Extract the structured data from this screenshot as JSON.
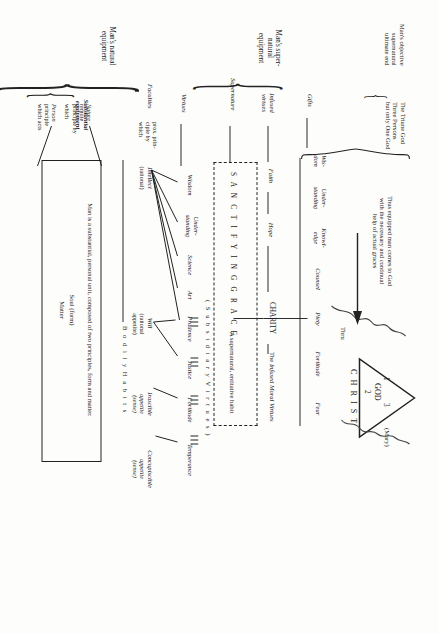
{
  "diagram": {
    "deity": {
      "label": "GOD",
      "person_numbers": [
        "1",
        "3",
        "2"
      ],
      "christ": "C H R I S T",
      "thru": "Thru",
      "mary": "(Mary)"
    },
    "objective_end": {
      "label": "Man's objective\nsupernatural\nultimate end",
      "line1": "Man's objective",
      "line2": "supernatural",
      "line3": "ultimate end",
      "content_line1": "The  Triune  God",
      "content_line2": "Three  Persons",
      "content_line3": "but only One God"
    },
    "note": {
      "line1": "Thus equipped man comes to God",
      "line2": "with the necessary and continual",
      "line3": "help of actual graces"
    },
    "supernatural_equipment": {
      "bracket_label_line1": "Man's super-",
      "bracket_label_line2": "natural",
      "bracket_label_line3": "equipment",
      "rows": [
        {
          "row_label": "Gifts",
          "items": [
            {
              "l1": "Wis-",
              "l2": "dom"
            },
            {
              "l1": "Under-",
              "l2": "standing"
            },
            {
              "l1": "Knowl-",
              "l2": "edge"
            },
            {
              "l1": "Counsel",
              "l2": ""
            },
            {
              "l1": "Piety",
              "l2": ""
            },
            {
              "l1": "Fortitude",
              "l2": ""
            },
            {
              "l1": "Fear",
              "l2": ""
            }
          ]
        },
        {
          "row_label_l1": "Infused",
          "row_label_l2": "virtues",
          "items": [
            {
              "l1": "Faith",
              "l2": ""
            },
            {
              "l1": "Hope",
              "l2": ""
            },
            {
              "l1": "CHARITY",
              "l2": ""
            },
            {
              "l1": "The Infused Moral Virtues",
              "l2": ""
            }
          ],
          "charity_caps": "CHARITY",
          "infused_moral_pre": "The ",
          "infused_moral_it": "Infused Moral Virtues"
        },
        {
          "row_label": "Supernature",
          "grace_text": "S A N C T I F Y I N G     G R A C E",
          "grace_desc": "A supernatural, entitative habit"
        }
      ]
    },
    "natural_equipment": {
      "bracket_label_line1": "Man's natural",
      "bracket_label_line2": "equipment",
      "virtues": {
        "row_label": "Virtues",
        "subsidiary_heading": "( S u b s i d i a r y   V i r t u e s )",
        "items": [
          {
            "l1": "Wisdom"
          },
          {
            "l1": "Under-",
            "l2": "standing"
          },
          {
            "l1": "Science"
          },
          {
            "l1": "Art"
          },
          {
            "l1": "Prudence"
          },
          {
            "l1": "Justice"
          },
          {
            "l1": "Fortitude"
          },
          {
            "l1": "Temperance"
          }
        ]
      },
      "faculties": {
        "row_label": "Faculties",
        "desc_l1": "prox. prin-",
        "desc_l2": "ciple by",
        "desc_l3": "which",
        "items": [
          {
            "name": "Intellect",
            "qual_l1": "(rational)",
            "qual_l2": ""
          },
          {
            "name": "Will",
            "qual_l1": "(rational",
            "qual_l2": "appetite)"
          },
          {
            "name": "Irascible",
            "qual_l1": "appetite",
            "qual_l2": "(sense)"
          },
          {
            "name": "Concupiscible",
            "qual_l1": "appetite",
            "qual_l2": "(sense)"
          }
        ],
        "bodily_habits": "B o d i l y      H a b i t s"
      },
      "substantial_equipment": {
        "row_label_l1": "Substantial",
        "row_label_l2": "equipment",
        "box_line1": "Man is a substantial, personal unit, composed of two principles, form and matter.",
        "box_line2": "Soul  (form)",
        "box_line3": "Matter",
        "nature": {
          "name": "Nature",
          "l1": "remote",
          "l2": "principle by",
          "l3": "which"
        },
        "person": {
          "name": "Person",
          "l1": "principle",
          "l2": "which acts"
        }
      }
    }
  }
}
